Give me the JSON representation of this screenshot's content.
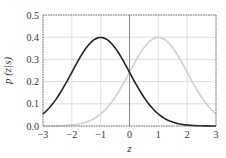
{
  "chart_data": {
    "type": "line",
    "title": "",
    "xlabel": "z",
    "ylabel": "p (z|s)",
    "xlim": [
      -3,
      3
    ],
    "ylim": [
      0,
      0.5
    ],
    "xticks": [
      -3,
      -2,
      -1,
      0,
      1,
      2,
      3
    ],
    "xtick_labels": [
      "−3",
      "−2",
      "−1",
      "0",
      "1",
      "2",
      "3"
    ],
    "yticks": [
      0.0,
      0.1,
      0.2,
      0.3,
      0.4,
      0.5
    ],
    "ytick_labels": [
      "0.0",
      "0.1",
      "0.2",
      "0.3",
      "0.4",
      "0.5"
    ],
    "grid": true,
    "legend": null,
    "vertical_line_at": 0,
    "series": [
      {
        "name": "dark curve (mean −1)",
        "color": "#222222",
        "distribution": "normal",
        "mean": -1,
        "std": 1,
        "x": [
          -3,
          -2.5,
          -2,
          -1.5,
          -1,
          -0.5,
          0,
          0.5,
          1,
          1.5,
          2,
          2.5,
          3
        ],
        "values": [
          0.054,
          0.13,
          0.242,
          0.352,
          0.399,
          0.352,
          0.242,
          0.13,
          0.054,
          0.018,
          0.004,
          0.001,
          0.0
        ]
      },
      {
        "name": "light curve (mean +1)",
        "color": "#d0d0d0",
        "distribution": "normal",
        "mean": 1,
        "std": 1,
        "x": [
          -3,
          -2.5,
          -2,
          -1.5,
          -1,
          -0.5,
          0,
          0.5,
          1,
          1.5,
          2,
          2.5,
          3
        ],
        "values": [
          0.0,
          0.001,
          0.004,
          0.018,
          0.054,
          0.13,
          0.242,
          0.352,
          0.399,
          0.352,
          0.242,
          0.13,
          0.054
        ]
      }
    ]
  },
  "layout": {
    "plot_left": 43,
    "plot_right": 216,
    "plot_top": 15,
    "plot_bottom": 126,
    "grid_color": "#d8d8d8",
    "axis_color": "#555555",
    "zero_line_color": "#888888"
  }
}
